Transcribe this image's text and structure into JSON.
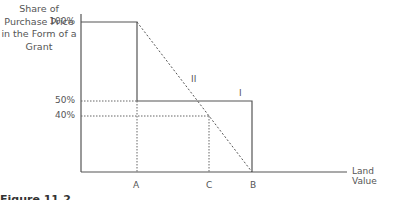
{
  "diagram": {
    "y_axis_label": "Share of Purchase Price in the Form of a Grant",
    "x_axis_label": "Land Value",
    "y_ticks": [
      "100%",
      "50%",
      "40%"
    ],
    "x_ticks": [
      "A",
      "C",
      "B"
    ],
    "line_labels": {
      "schedule_1": "I",
      "schedule_2": "II"
    },
    "caption_prefix": "Figure 11.2",
    "caption_text": ""
  }
}
